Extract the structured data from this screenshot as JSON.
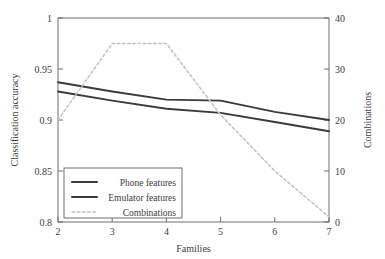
{
  "chart_data": {
    "type": "line",
    "title": "",
    "xlabel": "Families",
    "ylabel": "Classification accuracy",
    "y2label": "Combinations",
    "x": [
      2,
      3,
      4,
      5,
      6,
      7
    ],
    "xlim": [
      2,
      7
    ],
    "ylim": [
      0.8,
      1
    ],
    "y2lim": [
      0,
      40
    ],
    "xticks": [
      "2",
      "3",
      "4",
      "5",
      "6",
      "7"
    ],
    "yticks": [
      "0.8",
      "0.85",
      "0.9",
      "0.95",
      "1"
    ],
    "y2ticks": [
      "0",
      "10",
      "20",
      "30",
      "40"
    ],
    "grid": false,
    "legend_position": "lower-left-inside",
    "series": [
      {
        "name": "Phone features",
        "axis": "left",
        "style": "solid",
        "color": "#3a3a3a",
        "values": [
          0.937,
          0.928,
          0.92,
          0.919,
          0.908,
          0.9
        ]
      },
      {
        "name": "Emulator features",
        "axis": "left",
        "style": "solid",
        "color": "#3a3a3a",
        "values": [
          0.928,
          0.919,
          0.911,
          0.907,
          0.898,
          0.889
        ]
      },
      {
        "name": "Combinations",
        "axis": "right",
        "style": "dashed",
        "color": "#c3c3c3",
        "values": [
          20,
          35,
          35,
          21,
          10,
          1
        ]
      }
    ]
  },
  "axes": {
    "x_title": "Families",
    "y_left_title": "Classification accuracy",
    "y_right_title": "Combinations",
    "x_tick_labels": [
      "2",
      "3",
      "4",
      "5",
      "6",
      "7"
    ],
    "y_left_tick_labels": [
      "1",
      "0.95",
      "0.9",
      "0.85",
      "0.8"
    ],
    "y_right_tick_labels": [
      "40",
      "30",
      "20",
      "10",
      "0"
    ]
  },
  "legend": {
    "items": [
      {
        "label": "Phone features",
        "style": "solid",
        "color": "#3a3a3a"
      },
      {
        "label": "Emulator features",
        "style": "solid",
        "color": "#3a3a3a"
      },
      {
        "label": "Combinations",
        "style": "dashed",
        "color": "#c3c3c3"
      }
    ]
  },
  "colors": {
    "line_dark": "#3a3a3a",
    "line_dashed": "#c3c3c3",
    "axis": "#6e6e6e",
    "text": "#3c3c3c",
    "background": "#ffffff"
  }
}
